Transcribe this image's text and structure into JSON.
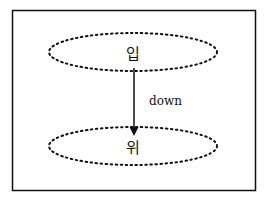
{
  "diagram": {
    "top_node": {
      "label": "입"
    },
    "bottom_node": {
      "label": "위"
    },
    "edge": {
      "label": "down"
    }
  }
}
